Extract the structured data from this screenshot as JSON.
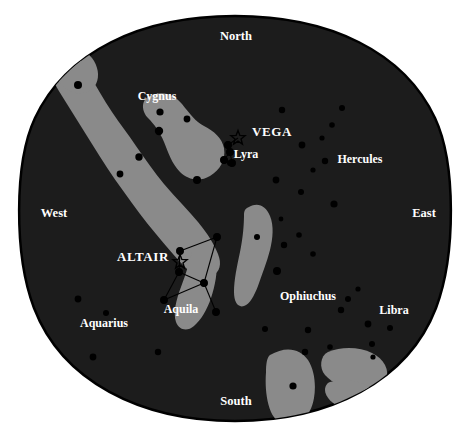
{
  "chart": {
    "type": "sky-map",
    "horizon_shape": "circular sky dome",
    "colors": {
      "page_background": "#ffffff",
      "sky_background": "#1c1c1c",
      "milky_way": "#8a8a8a",
      "star": "#000000",
      "label_text": "#ffffff",
      "horizon_outline": "#000000",
      "constellation_line": "#000000"
    },
    "cardinal_points": [
      {
        "name": "north-label",
        "label": "North",
        "x": 236,
        "y": 40
      },
      {
        "name": "east-label",
        "label": "East",
        "x": 424,
        "y": 217
      },
      {
        "name": "south-label",
        "label": "South",
        "x": 236,
        "y": 405
      },
      {
        "name": "west-label",
        "label": "West",
        "x": 54,
        "y": 217
      }
    ],
    "constellations": [
      {
        "name": "cygnus-label",
        "label": "Cygnus",
        "x": 157,
        "y": 100
      },
      {
        "name": "lyra-label",
        "label": "Lyra",
        "x": 246,
        "y": 158
      },
      {
        "name": "hercules-label",
        "label": "Hercules",
        "x": 360,
        "y": 163
      },
      {
        "name": "aquila-label",
        "label": "Aquila",
        "x": 181,
        "y": 313
      },
      {
        "name": "ophiuchus-label",
        "label": "Ophiuchus",
        "x": 308,
        "y": 300
      },
      {
        "name": "libra-label",
        "label": "Libra",
        "x": 394,
        "y": 314
      },
      {
        "name": "aquarius-label",
        "label": "Aquarius",
        "x": 104,
        "y": 327
      }
    ],
    "bright_stars": [
      {
        "name": "vega-label",
        "label": "VEGA",
        "x": 272,
        "y": 136,
        "marker_x": 238,
        "marker_y": 138
      },
      {
        "name": "altair-label",
        "label": "ALTAIR",
        "x": 143,
        "y": 261,
        "marker_x": 180,
        "marker_y": 262
      }
    ],
    "stars": [
      {
        "x": 78,
        "y": 85,
        "r": 4.0
      },
      {
        "x": 160,
        "y": 112,
        "r": 3.6
      },
      {
        "x": 159,
        "y": 131,
        "r": 4.2
      },
      {
        "x": 187,
        "y": 119,
        "r": 3.4
      },
      {
        "x": 197,
        "y": 180,
        "r": 4.0
      },
      {
        "x": 139,
        "y": 157,
        "r": 3.7
      },
      {
        "x": 120,
        "y": 174,
        "r": 3.4
      },
      {
        "x": 228,
        "y": 145,
        "r": 3.6
      },
      {
        "x": 224,
        "y": 160,
        "r": 3.3
      },
      {
        "x": 230,
        "y": 163,
        "r": 3.0
      },
      {
        "x": 282,
        "y": 110,
        "r": 3.2
      },
      {
        "x": 342,
        "y": 108,
        "r": 3.0
      },
      {
        "x": 332,
        "y": 125,
        "r": 2.8
      },
      {
        "x": 302,
        "y": 145,
        "r": 3.4
      },
      {
        "x": 322,
        "y": 138,
        "r": 2.6
      },
      {
        "x": 276,
        "y": 180,
        "r": 3.4
      },
      {
        "x": 301,
        "y": 192,
        "r": 3.0
      },
      {
        "x": 325,
        "y": 161,
        "r": 3.2
      },
      {
        "x": 313,
        "y": 170,
        "r": 2.6
      },
      {
        "x": 334,
        "y": 204,
        "r": 3.6
      },
      {
        "x": 281,
        "y": 219,
        "r": 2.4
      },
      {
        "x": 299,
        "y": 235,
        "r": 2.8
      },
      {
        "x": 284,
        "y": 245,
        "r": 3.2
      },
      {
        "x": 313,
        "y": 254,
        "r": 2.8
      },
      {
        "x": 277,
        "y": 271,
        "r": 4.0
      },
      {
        "x": 257,
        "y": 237,
        "r": 3.0
      },
      {
        "x": 348,
        "y": 299,
        "r": 3.0
      },
      {
        "x": 358,
        "y": 289,
        "r": 2.6
      },
      {
        "x": 341,
        "y": 310,
        "r": 3.2
      },
      {
        "x": 368,
        "y": 324,
        "r": 3.4
      },
      {
        "x": 390,
        "y": 328,
        "r": 3.0
      },
      {
        "x": 308,
        "y": 330,
        "r": 3.2
      },
      {
        "x": 265,
        "y": 329,
        "r": 3.0
      },
      {
        "x": 330,
        "y": 347,
        "r": 2.8
      },
      {
        "x": 372,
        "y": 344,
        "r": 3.0
      },
      {
        "x": 305,
        "y": 352,
        "r": 3.2
      },
      {
        "x": 373,
        "y": 357,
        "r": 2.6
      },
      {
        "x": 293,
        "y": 386,
        "r": 3.6
      },
      {
        "x": 78,
        "y": 299,
        "r": 3.4
      },
      {
        "x": 106,
        "y": 313,
        "r": 3.0
      },
      {
        "x": 93,
        "y": 357,
        "r": 3.4
      },
      {
        "x": 158,
        "y": 352,
        "r": 3.2
      }
    ],
    "aquila_asterism": {
      "nodes": [
        {
          "id": "tarazed",
          "x": 180,
          "y": 251
        },
        {
          "id": "altair",
          "x": 180,
          "y": 262
        },
        {
          "id": "alshain",
          "x": 179,
          "y": 272
        },
        {
          "id": "delta",
          "x": 204,
          "y": 283
        },
        {
          "id": "zeta",
          "x": 217,
          "y": 237
        },
        {
          "id": "theta",
          "x": 216,
          "y": 312
        },
        {
          "id": "lambda",
          "x": 164,
          "y": 300
        }
      ],
      "edges": [
        [
          "tarazed",
          "zeta"
        ],
        [
          "zeta",
          "delta"
        ],
        [
          "delta",
          "alshain"
        ],
        [
          "alshain",
          "tarazed"
        ],
        [
          "delta",
          "theta"
        ],
        [
          "delta",
          "lambda"
        ],
        [
          "lambda",
          "alshain"
        ]
      ]
    },
    "lyra_asterism": {
      "nodes": [
        {
          "id": "vega",
          "x": 238,
          "y": 138
        },
        {
          "id": "epsilon",
          "x": 228,
          "y": 145
        },
        {
          "id": "zeta",
          "x": 230,
          "y": 152
        },
        {
          "id": "beta",
          "x": 224,
          "y": 160
        },
        {
          "id": "gamma",
          "x": 232,
          "y": 163
        }
      ],
      "edges": [
        [
          "vega",
          "epsilon"
        ],
        [
          "epsilon",
          "zeta"
        ],
        [
          "zeta",
          "beta"
        ],
        [
          "beta",
          "gamma"
        ],
        [
          "gamma",
          "zeta"
        ]
      ]
    }
  }
}
